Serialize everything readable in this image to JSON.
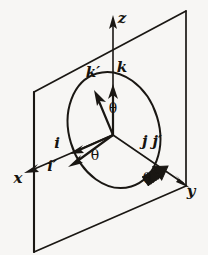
{
  "figure": {
    "background_color": "#f7f6f4",
    "ink_color": "#1a1713",
    "axes": [
      {
        "id": "x",
        "label": "x",
        "label_x": 18,
        "label_y": 183,
        "direction": "down-left-front"
      },
      {
        "id": "y",
        "label": "y",
        "label_x": 191,
        "label_y": 196,
        "direction": "down-right-back"
      },
      {
        "id": "z",
        "label": "z",
        "label_x": 122,
        "label_y": 23,
        "direction": "up"
      }
    ],
    "vectors": [
      {
        "id": "k",
        "label": "k",
        "label_x": 122,
        "label_y": 72,
        "description": "original unit vector along z"
      },
      {
        "id": "k-prime",
        "label": "k′",
        "label_x": 93,
        "label_y": 77,
        "description": "rotated unit vector, tilted from z"
      },
      {
        "id": "i",
        "label": "i",
        "label_x": 57,
        "label_y": 148,
        "description": "original unit vector along x"
      },
      {
        "id": "i-prime",
        "label": "i′",
        "label_x": 52,
        "label_y": 171,
        "description": "rotated unit vector, tilted from x"
      },
      {
        "id": "j-jprime",
        "label": "j j′",
        "label_x": 152,
        "label_y": 146,
        "description": "unit vector along y, unchanged by the rotation"
      }
    ],
    "angles": [
      {
        "id": "theta-top",
        "label": "θ",
        "label_x": 113,
        "label_y": 113,
        "between": "z and k′"
      },
      {
        "id": "theta-left",
        "label": "θ",
        "label_x": 95,
        "label_y": 160,
        "between": "i and i′"
      },
      {
        "id": "theta-right",
        "label": "θ",
        "label_x": 147,
        "label_y": 183,
        "between": "y axis and plane edge"
      }
    ],
    "shapes": [
      {
        "id": "plane",
        "type": "parallelogram",
        "description": "tilted reference plane containing x and z"
      },
      {
        "id": "circle",
        "type": "ellipse",
        "description": "unit circle of the rotation drawn in perspective"
      },
      {
        "id": "j-arrow",
        "type": "hatched-block-arrow",
        "description": "shaded arrow along y marking j j′"
      }
    ]
  }
}
